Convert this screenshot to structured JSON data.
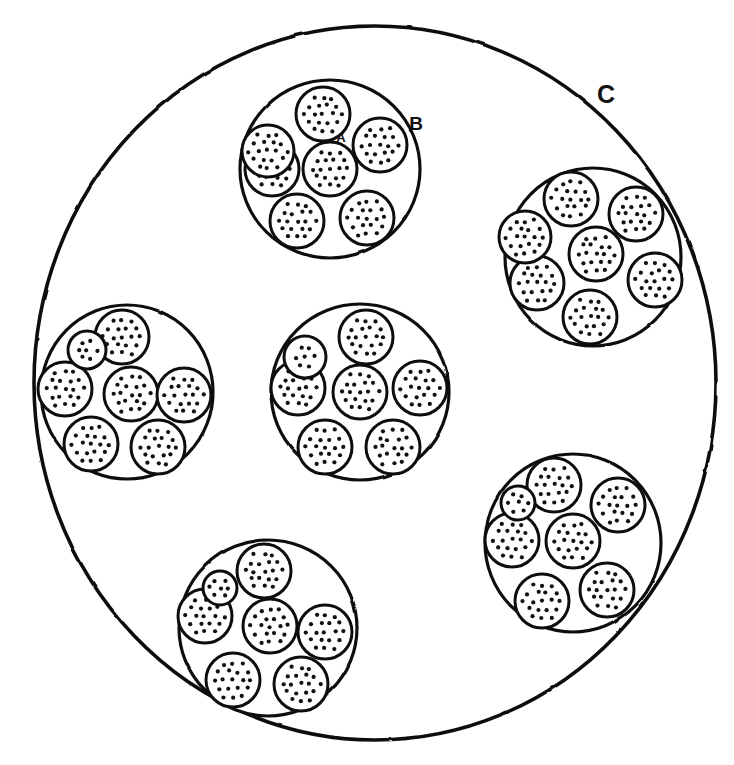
{
  "figure": {
    "background_color": "#ffffff",
    "ink_color": "#111111",
    "width": 734,
    "height": 765
  },
  "labels": [
    {
      "id": "A",
      "text": "A",
      "x": 341,
      "y": 139,
      "font_size": 13,
      "refers_to": "small-dotted-unit-circle"
    },
    {
      "id": "B",
      "text": "B",
      "x": 416,
      "y": 125,
      "font_size": 19,
      "refers_to": "medium-cluster-circle"
    },
    {
      "id": "C",
      "text": "C",
      "x": 606,
      "y": 96,
      "font_size": 25,
      "refers_to": "large-outer-circle"
    }
  ],
  "outer_circle": {
    "name": "C",
    "cx": 375,
    "cy": 383,
    "rx": 341,
    "ry": 357,
    "stroke_width": 3.6,
    "stroke_color": "#111111",
    "fill_color": "#ffffff"
  },
  "unit_circle_style": {
    "r": 26,
    "stroke_width": 3.0,
    "stroke_color": "#111111",
    "fill_color": "#ffffff",
    "dot_color": "#111111",
    "dot_radius": 2.1,
    "dot_spacing": 9.2,
    "dot_count_approx": 18
  },
  "cluster_style": {
    "r": 88,
    "stroke_width": 3.2,
    "stroke_color": "#111111",
    "fill_color": "#ffffff",
    "ring_radius": 55,
    "units_per_cluster": 7
  },
  "counts": {
    "outer_circles": 1,
    "clusters": 6,
    "units_per_cluster": 7,
    "total_units": 42
  },
  "clusters": [
    {
      "id": "cluster-top-center",
      "cx": 330,
      "cy": 169,
      "r": 89,
      "rx": 90,
      "ry": 89,
      "ring_rotation_deg": 0,
      "ring_radius": 56,
      "units": [
        {
          "id": "unit-center",
          "dx": 0,
          "dy": 0,
          "r": 27
        },
        {
          "id": "unit-n",
          "dx": -7,
          "dy": -55,
          "r": 27
        },
        {
          "id": "unit-ne",
          "dx": 50,
          "dy": -24,
          "r": 27
        },
        {
          "id": "unit-se",
          "dx": 37,
          "dy": 49,
          "r": 27
        },
        {
          "id": "unit-s",
          "dx": -33,
          "dy": 52,
          "r": 27
        },
        {
          "id": "unit-sw",
          "dx": -58,
          "dy": 0,
          "r": 27
        },
        {
          "id": "unit-nw",
          "dx": -62,
          "dy": -18,
          "r": 26
        }
      ]
    },
    {
      "id": "cluster-top-right",
      "cx": 593,
      "cy": 257,
      "r": 88,
      "rx": 88,
      "ry": 89,
      "ring_rotation_deg": 12,
      "ring_radius": 56,
      "units": [
        {
          "id": "unit-center",
          "dx": 3,
          "dy": -3,
          "r": 27
        },
        {
          "id": "unit-n",
          "dx": -22,
          "dy": -58,
          "r": 27
        },
        {
          "id": "unit-ne",
          "dx": 43,
          "dy": -43,
          "r": 27
        },
        {
          "id": "unit-e",
          "dx": 62,
          "dy": 23,
          "r": 27
        },
        {
          "id": "unit-se",
          "dx": -3,
          "dy": 60,
          "r": 27
        },
        {
          "id": "unit-sw",
          "dx": -56,
          "dy": 26,
          "r": 27
        },
        {
          "id": "unit-nw",
          "dx": -68,
          "dy": -20,
          "r": 26
        }
      ]
    },
    {
      "id": "cluster-left",
      "cx": 127,
      "cy": 392,
      "r": 86,
      "rx": 86,
      "ry": 87,
      "ring_rotation_deg": 0,
      "ring_radius": 55,
      "units": [
        {
          "id": "unit-center",
          "dx": 4,
          "dy": 2,
          "r": 27
        },
        {
          "id": "unit-n",
          "dx": -5,
          "dy": -55,
          "r": 27
        },
        {
          "id": "unit-e",
          "dx": 57,
          "dy": 3,
          "r": 27
        },
        {
          "id": "unit-se",
          "dx": 31,
          "dy": 55,
          "r": 27
        },
        {
          "id": "unit-sw",
          "dx": -36,
          "dy": 52,
          "r": 27
        },
        {
          "id": "unit-w",
          "dx": -62,
          "dy": -3,
          "r": 27
        },
        {
          "id": "unit-nw",
          "dx": -40,
          "dy": -42,
          "r": 19
        }
      ]
    },
    {
      "id": "cluster-center",
      "cx": 360,
      "cy": 392,
      "r": 88,
      "rx": 89,
      "ry": 88,
      "ring_rotation_deg": 0,
      "ring_radius": 56,
      "units": [
        {
          "id": "unit-center",
          "dx": 0,
          "dy": 0,
          "r": 27
        },
        {
          "id": "unit-n",
          "dx": 6,
          "dy": -55,
          "r": 27
        },
        {
          "id": "unit-e",
          "dx": 60,
          "dy": -4,
          "r": 27
        },
        {
          "id": "unit-se",
          "dx": 33,
          "dy": 55,
          "r": 27
        },
        {
          "id": "unit-sw",
          "dx": -35,
          "dy": 55,
          "r": 27
        },
        {
          "id": "unit-w",
          "dx": -62,
          "dy": -4,
          "r": 27
        },
        {
          "id": "unit-nw",
          "dx": -55,
          "dy": -35,
          "r": 21
        }
      ]
    },
    {
      "id": "cluster-bottom-right",
      "cx": 573,
      "cy": 543,
      "r": 88,
      "rx": 88,
      "ry": 89,
      "ring_rotation_deg": 8,
      "ring_radius": 56,
      "units": [
        {
          "id": "unit-center",
          "dx": 0,
          "dy": -2,
          "r": 27
        },
        {
          "id": "unit-n",
          "dx": -19,
          "dy": -58,
          "r": 27
        },
        {
          "id": "unit-ne",
          "dx": 45,
          "dy": -38,
          "r": 27
        },
        {
          "id": "unit-se",
          "dx": 34,
          "dy": 47,
          "r": 27
        },
        {
          "id": "unit-s",
          "dx": -31,
          "dy": 58,
          "r": 27
        },
        {
          "id": "unit-w",
          "dx": -61,
          "dy": -3,
          "r": 27
        },
        {
          "id": "unit-nw",
          "dx": -55,
          "dy": -40,
          "r": 17
        }
      ]
    },
    {
      "id": "cluster-bottom-center",
      "cx": 268,
      "cy": 628,
      "r": 88,
      "rx": 89,
      "ry": 88,
      "ring_rotation_deg": 6,
      "ring_radius": 56,
      "units": [
        {
          "id": "unit-center",
          "dx": 2,
          "dy": -2,
          "r": 27
        },
        {
          "id": "unit-n",
          "dx": -4,
          "dy": -57,
          "r": 27
        },
        {
          "id": "unit-e",
          "dx": 57,
          "dy": 4,
          "r": 27
        },
        {
          "id": "unit-se",
          "dx": 33,
          "dy": 56,
          "r": 27
        },
        {
          "id": "unit-sw",
          "dx": -35,
          "dy": 52,
          "r": 27
        },
        {
          "id": "unit-w",
          "dx": -63,
          "dy": -12,
          "r": 27
        },
        {
          "id": "unit-nw",
          "dx": -48,
          "dy": -40,
          "r": 17
        }
      ]
    }
  ]
}
